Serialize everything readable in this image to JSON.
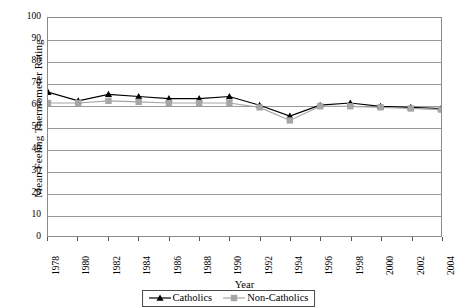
{
  "chart_data": {
    "type": "line",
    "title": "",
    "xlabel": "Year",
    "ylabel": "Mean Feeling Thermometer Rating",
    "ylim": [
      0,
      100
    ],
    "ytick_step": 10,
    "xlim": [
      1978,
      2004
    ],
    "xtick_step": 2,
    "grid": true,
    "legend_position": "bottom-center",
    "x": [
      1978,
      1980,
      1982,
      1984,
      1986,
      1988,
      1990,
      1992,
      1994,
      1996,
      1998,
      2000,
      2002,
      2004
    ],
    "categories": [
      "1978",
      "1980",
      "1982",
      "1984",
      "1986",
      "1988",
      "1990",
      "1992",
      "1994",
      "1996",
      "1998",
      "2000",
      "2002",
      "2004"
    ],
    "series": [
      {
        "name": "Catholics",
        "color": "#000000",
        "marker": "triangle",
        "values": [
          66,
          62,
          65,
          64,
          63,
          63,
          64,
          60,
          55,
          60,
          61,
          59.5,
          59,
          58.5
        ]
      },
      {
        "name": "Non-Catholics",
        "color": "#a6a6a6",
        "marker": "square",
        "values": [
          61,
          61,
          62,
          61.5,
          61,
          61,
          61,
          59,
          53,
          59.5,
          59.5,
          59,
          58.5,
          58
        ]
      }
    ],
    "ytick_labels": [
      "0",
      "10",
      "20",
      "30",
      "40",
      "50",
      "60",
      "70",
      "80",
      "90",
      "100"
    ],
    "ytick_values": [
      0,
      10,
      20,
      30,
      40,
      50,
      60,
      70,
      80,
      90,
      100
    ]
  },
  "legend": {
    "items": [
      {
        "label": "Catholics"
      },
      {
        "label": "Non-Catholics"
      }
    ]
  }
}
